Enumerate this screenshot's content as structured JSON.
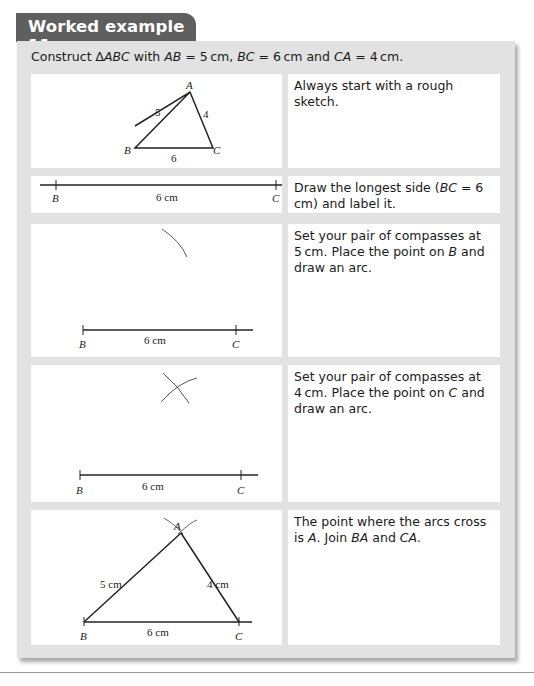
{
  "header": {
    "title": "Worked example 11"
  },
  "problem": {
    "prefix": "Construct ",
    "triangle": "∆ABC",
    "middle": " with ",
    "ab": "AB",
    "ab_val": " = 5 cm, ",
    "bc": "BC",
    "bc_val": " = 6 cm and ",
    "ca": "CA",
    "ca_val": " = 4 cm."
  },
  "steps": [
    {
      "text": "Always start with a rough sketch.",
      "figure": {
        "labels": {
          "A": "A",
          "B": "B",
          "C": "C",
          "ab": "5",
          "ca": "4",
          "bc": "6"
        }
      }
    },
    {
      "text_a": "Draw the longest side (",
      "text_b": "BC",
      "text_c": " = 6 cm) and label it.",
      "figure": {
        "labels": {
          "B": "B",
          "C": "C",
          "bc": "6 cm"
        }
      }
    },
    {
      "text_a": "Set your pair of compasses at 5 cm. Place the point on ",
      "text_b": "B",
      "text_c": " and draw an arc.",
      "figure": {
        "labels": {
          "B": "B",
          "C": "C",
          "bc": "6 cm"
        }
      }
    },
    {
      "text_a": "Set your pair of compasses at 4 cm. Place the point on ",
      "text_b": "C",
      "text_c": " and draw an arc.",
      "figure": {
        "labels": {
          "B": "B",
          "C": "C",
          "bc": "6 cm"
        }
      }
    },
    {
      "text_a": "The point where the arcs cross is ",
      "text_b": "A",
      "text_c": ". Join ",
      "text_d": "BA",
      "text_e": " and ",
      "text_f": "CA",
      "text_g": ".",
      "figure": {
        "labels": {
          "A": "A",
          "B": "B",
          "C": "C",
          "ab": "5 cm",
          "ca": "4 cm",
          "bc": "6 cm"
        }
      }
    }
  ]
}
